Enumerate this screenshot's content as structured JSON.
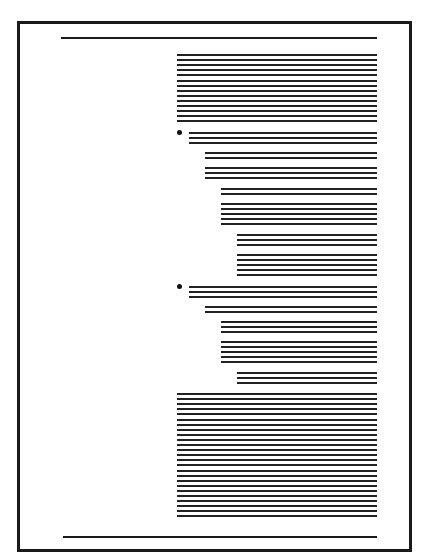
{
  "diagram": {
    "title": "",
    "colors": {
      "ink": "#1a1a1a",
      "paper": "#ffffff"
    },
    "frame": {
      "left": 17,
      "top": 21,
      "right": 409,
      "bottom": 549
    },
    "top_rule": {
      "x1": 61,
      "x2": 377,
      "y": 37
    },
    "bottom_rule": {
      "x1": 63,
      "x2": 377,
      "y": 536
    },
    "line_right_edge": 377,
    "line_pitch": 5.1,
    "blocks": [
      {
        "x": 177,
        "y": 54,
        "count": 14
      },
      {
        "x": 189,
        "y": 132,
        "count": 3,
        "bullet": true
      },
      {
        "x": 205,
        "y": 152,
        "count": 2
      },
      {
        "x": 205,
        "y": 167,
        "count": 3
      },
      {
        "x": 221,
        "y": 188,
        "count": 2
      },
      {
        "x": 221,
        "y": 203,
        "count": 5
      },
      {
        "x": 237,
        "y": 234,
        "count": 3
      },
      {
        "x": 237,
        "y": 254,
        "count": 5
      },
      {
        "x": 189,
        "y": 286,
        "count": 3,
        "bullet": true
      },
      {
        "x": 205,
        "y": 306,
        "count": 2
      },
      {
        "x": 221,
        "y": 321,
        "count": 3
      },
      {
        "x": 221,
        "y": 341,
        "count": 5
      },
      {
        "x": 237,
        "y": 372,
        "count": 3
      },
      {
        "x": 177,
        "y": 393,
        "count": 25
      }
    ]
  }
}
